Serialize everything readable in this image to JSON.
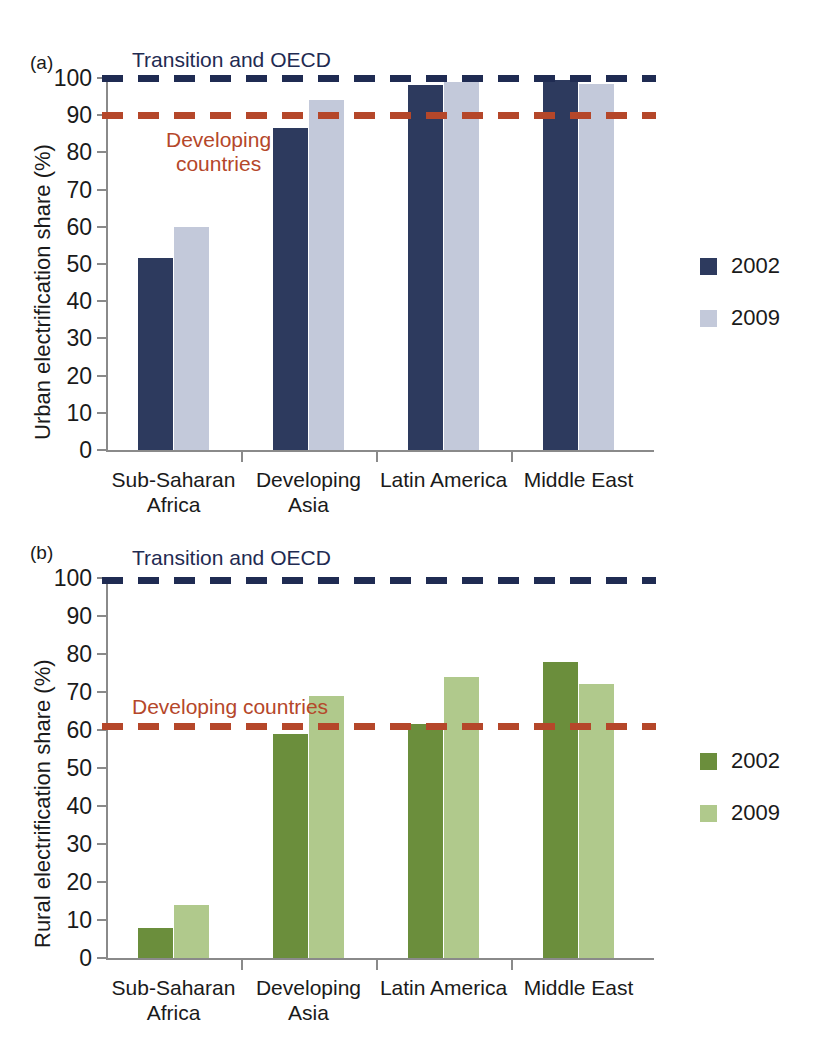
{
  "figure": {
    "background": "#ffffff",
    "panels": [
      {
        "tag": "(a)",
        "ylabel": "Urban electrification share (%)"
      },
      {
        "tag": "(b)",
        "ylabel": "Rural electrification share (%)"
      }
    ]
  },
  "colors": {
    "series_2002_urban": "#2d3a5e",
    "series_2009_urban": "#c3c9da",
    "series_2002_rural": "#6b8e3c",
    "series_2009_rural": "#b0c98c",
    "transition_oecd_line": "#1f2b52",
    "developing_line": "#b5472a",
    "axis": "#8a8a8a",
    "text": "#1a1a1a"
  },
  "chart_data": [
    {
      "type": "bar",
      "panel": "(a)",
      "title": "",
      "xlabel": "",
      "ylabel": "Urban electrification share (%)",
      "ylim": [
        0,
        100
      ],
      "yticks": [
        0,
        10,
        20,
        30,
        40,
        50,
        60,
        70,
        80,
        90,
        100
      ],
      "ytick_labels": [
        "0",
        "10",
        "20",
        "30",
        "40",
        "50",
        "60",
        "70",
        "80",
        "90",
        "100"
      ],
      "grid": false,
      "legend_position": "right",
      "categories": [
        "Sub-Saharan Africa",
        "Developing Asia",
        "Latin America",
        "Middle East"
      ],
      "category_lines": [
        [
          "Sub-Saharan",
          "Africa"
        ],
        [
          "Developing",
          "Asia"
        ],
        [
          "Latin America"
        ],
        [
          "Middle East"
        ]
      ],
      "series": [
        {
          "name": "2002",
          "color": "#2d3a5e",
          "values": [
            51.5,
            86.5,
            98.0,
            99.5
          ]
        },
        {
          "name": "2009",
          "color": "#c3c9da",
          "values": [
            60.0,
            94.0,
            99.0,
            98.5
          ]
        }
      ],
      "reference_lines": [
        {
          "label": "Transition and OECD",
          "value": 100,
          "color": "#1f2b52",
          "style": "dashed"
        },
        {
          "label": "Developing countries",
          "value": 90,
          "color": "#b5472a",
          "style": "dashed"
        }
      ],
      "annotations": [
        {
          "text": "Transition and OECD",
          "color": "#1f2b52"
        },
        {
          "text": "Developing countries",
          "color": "#b5472a",
          "lines": [
            "Developing",
            "countries"
          ]
        }
      ]
    },
    {
      "type": "bar",
      "panel": "(b)",
      "title": "",
      "xlabel": "",
      "ylabel": "Rural electrification share (%)",
      "ylim": [
        0,
        100
      ],
      "yticks": [
        0,
        10,
        20,
        30,
        40,
        50,
        60,
        70,
        80,
        90,
        100
      ],
      "ytick_labels": [
        "0",
        "10",
        "20",
        "30",
        "40",
        "50",
        "60",
        "70",
        "80",
        "90",
        "100"
      ],
      "grid": false,
      "legend_position": "right",
      "categories": [
        "Sub-Saharan Africa",
        "Developing Asia",
        "Latin America",
        "Middle East"
      ],
      "category_lines": [
        [
          "Sub-Saharan",
          "Africa"
        ],
        [
          "Developing",
          "Asia"
        ],
        [
          "Latin America"
        ],
        [
          "Middle East"
        ]
      ],
      "series": [
        {
          "name": "2002",
          "color": "#6b8e3c",
          "values": [
            8.0,
            59.0,
            61.5,
            78.0
          ]
        },
        {
          "name": "2009",
          "color": "#b0c98c",
          "values": [
            14.0,
            69.0,
            74.0,
            72.0
          ]
        }
      ],
      "reference_lines": [
        {
          "label": "Transition and OECD",
          "value": 99.5,
          "color": "#1f2b52",
          "style": "dashed"
        },
        {
          "label": "Developing countries",
          "value": 61.0,
          "color": "#b5472a",
          "style": "dashed"
        }
      ],
      "annotations": [
        {
          "text": "Transition and OECD",
          "color": "#1f2b52"
        },
        {
          "text": "Developing countries",
          "color": "#b5472a",
          "lines": [
            "Developing countries"
          ]
        }
      ]
    }
  ],
  "panel_a": {
    "tag": "(a)",
    "ylabel": "Urban electrification share (%)",
    "ticks": [
      "100",
      "90",
      "80",
      "70",
      "60",
      "50",
      "40",
      "30",
      "20",
      "10",
      "0"
    ],
    "ann_oecd": "Transition and OECD",
    "ann_dev_line1": "Developing",
    "ann_dev_line2": "countries",
    "cats": [
      {
        "line1": "Sub-Saharan",
        "line2": "Africa"
      },
      {
        "line1": "Developing",
        "line2": "Asia"
      },
      {
        "line1": "Latin America",
        "line2": ""
      },
      {
        "line1": "Middle East",
        "line2": ""
      }
    ],
    "legend": [
      {
        "label": "2002",
        "color": "#2d3a5e"
      },
      {
        "label": "2009",
        "color": "#c3c9da"
      }
    ]
  },
  "panel_b": {
    "tag": "(b)",
    "ylabel": "Rural electrification share (%)",
    "ticks": [
      "100",
      "90",
      "80",
      "70",
      "60",
      "50",
      "40",
      "30",
      "20",
      "10",
      "0"
    ],
    "ann_oecd": "Transition and OECD",
    "ann_dev_line1": "Developing countries",
    "cats": [
      {
        "line1": "Sub-Saharan",
        "line2": "Africa"
      },
      {
        "line1": "Developing",
        "line2": "Asia"
      },
      {
        "line1": "Latin America",
        "line2": ""
      },
      {
        "line1": "Middle East",
        "line2": ""
      }
    ],
    "legend": [
      {
        "label": "2002",
        "color": "#6b8e3c"
      },
      {
        "label": "2009",
        "color": "#b0c98c"
      }
    ]
  }
}
